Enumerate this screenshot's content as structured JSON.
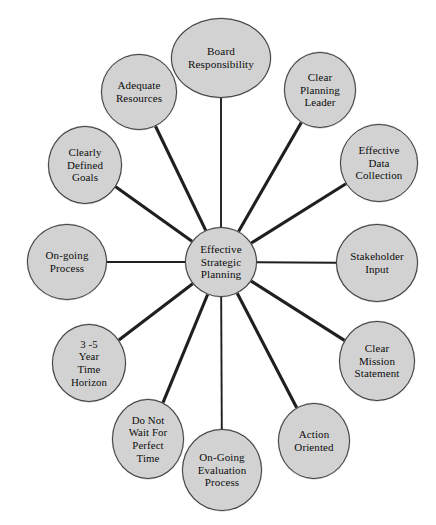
{
  "diagram": {
    "title": "Effective Strategic Planning",
    "type": "hub-and-spoke radial diagram",
    "colors": {
      "node_fill": "#d2d2d2",
      "node_stroke": "#3d3d3d",
      "spoke_stroke": "#1f1f1f",
      "text": "#0d0d0d",
      "background": "#ffffff"
    },
    "hub": {
      "label": "Effective\nStrategic\nPlanning",
      "cx": 221,
      "cy": 262,
      "rx": 36,
      "ry": 35,
      "font_size": 11.2
    },
    "spokes": [
      {
        "id": "board-responsibility",
        "label": "Board\nResponsibility",
        "cx": 221,
        "cy": 58,
        "rx": 50,
        "ry": 40,
        "font_size": 11.2,
        "angle": 270
      },
      {
        "id": "clear-planning-leader",
        "label": "Clear\nPlanning\nLeader",
        "cx": 320,
        "cy": 90,
        "rx": 36,
        "ry": 38,
        "font_size": 11.0,
        "angle": 300
      },
      {
        "id": "effective-data-collection",
        "label": "Effective\nData\nCollection",
        "cx": 379,
        "cy": 163,
        "rx": 39,
        "ry": 39,
        "font_size": 11.0,
        "angle": 330
      },
      {
        "id": "stakeholder-input",
        "label": "Stakeholder\nInput",
        "cx": 377,
        "cy": 263,
        "rx": 41,
        "ry": 39,
        "font_size": 11.0,
        "angle": 0
      },
      {
        "id": "clear-mission-statement",
        "label": "Clear\nMission\nStatement",
        "cx": 377,
        "cy": 361,
        "rx": 38,
        "ry": 40,
        "font_size": 11.0,
        "angle": 30
      },
      {
        "id": "action-oriented",
        "label": "Action\nOriented",
        "cx": 314,
        "cy": 441,
        "rx": 36,
        "ry": 38,
        "font_size": 11.0,
        "angle": 60
      },
      {
        "id": "on-going-evaluation-process",
        "label": "On-Going\nEvaluation\nProcess",
        "cx": 222,
        "cy": 470,
        "rx": 40,
        "ry": 41,
        "font_size": 11.0,
        "angle": 90
      },
      {
        "id": "do-not-wait-for-perfect-time",
        "label": "Do Not\nWait For\nPerfect\nTime",
        "cx": 148,
        "cy": 439,
        "rx": 36,
        "ry": 40,
        "font_size": 10.8,
        "angle": 120
      },
      {
        "id": "three-to-five-year-time-horizon",
        "label": "3 -5\nYear\nTime\nHorizon",
        "cx": 89,
        "cy": 363,
        "rx": 37,
        "ry": 39,
        "font_size": 10.8,
        "angle": 150
      },
      {
        "id": "on-going-process",
        "label": "On-going\nProcess",
        "cx": 67,
        "cy": 262,
        "rx": 40,
        "ry": 38,
        "font_size": 11.0,
        "angle": 180
      },
      {
        "id": "clearly-defined-goals",
        "label": "Clearly\nDefined\nGoals",
        "cx": 85,
        "cy": 165,
        "rx": 37,
        "ry": 39,
        "font_size": 11.0,
        "angle": 210
      },
      {
        "id": "adequate-resources",
        "label": "Adequate\nResources",
        "cx": 139,
        "cy": 92,
        "rx": 38,
        "ry": 38,
        "font_size": 11.0,
        "angle": 240
      }
    ]
  }
}
